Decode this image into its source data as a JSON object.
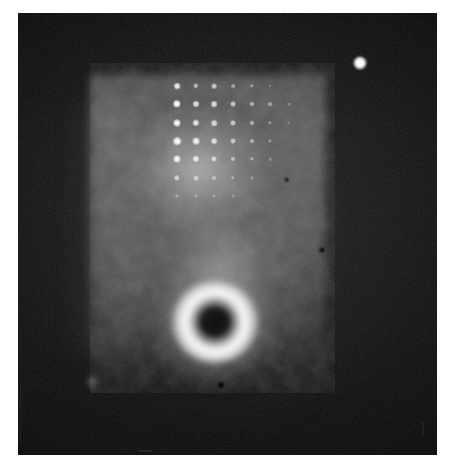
{
  "figure": {
    "kind": "photographic-plate-image",
    "caption": "",
    "background_color": "#ffffff",
    "plate_color": "#070707",
    "plate": {
      "x": 18,
      "y": 13,
      "width": 419,
      "height": 442
    }
  },
  "chart_data": {
    "type": "scatter",
    "title": "",
    "subtitle": "",
    "xlabel": "",
    "ylabel": "",
    "grid": false,
    "legend": "none",
    "xlim": [
      0,
      419
    ],
    "ylim": [
      0,
      442
    ],
    "features": [
      {
        "name": "diffuse-glow-field",
        "shape": "rectangle",
        "x": 72,
        "y": 62,
        "width": 235,
        "height": 316,
        "peak_brightness": 0.72,
        "color": "#b9b9b9"
      },
      {
        "name": "bright-annulus",
        "shape": "annulus",
        "cx": 197,
        "cy": 309,
        "outer_radius": 43,
        "inner_radius": 13,
        "peak_brightness": 0.99,
        "core_brightness": 0.09,
        "color": "#fcfcfc"
      },
      {
        "name": "isolated-bright-spot",
        "shape": "point",
        "cx": 342,
        "cy": 50,
        "radius": 6.5,
        "brightness": 1.0,
        "color": "#ffffff"
      }
    ],
    "lattice": {
      "name": "bright-dot-lattice",
      "rows": 6,
      "cols": 7,
      "origin_x": 159,
      "origin_y": 73,
      "dx": 18.6,
      "dy": 18.2,
      "points": [
        {
          "row": 0,
          "col": 0,
          "x": 159,
          "y": 73,
          "r": 2.6,
          "i": 0.9
        },
        {
          "row": 0,
          "col": 1,
          "x": 178,
          "y": 73,
          "r": 2.1,
          "i": 0.62
        },
        {
          "row": 0,
          "col": 2,
          "x": 196,
          "y": 73,
          "r": 2.2,
          "i": 0.7
        },
        {
          "row": 0,
          "col": 3,
          "x": 215,
          "y": 73,
          "r": 1.8,
          "i": 0.46
        },
        {
          "row": 0,
          "col": 4,
          "x": 234,
          "y": 73,
          "r": 1.7,
          "i": 0.4
        },
        {
          "row": 0,
          "col": 5,
          "x": 252,
          "y": 73,
          "r": 1.3,
          "i": 0.22
        },
        {
          "row": 1,
          "col": 0,
          "x": 159,
          "y": 91,
          "r": 3.2,
          "i": 1.0
        },
        {
          "row": 1,
          "col": 1,
          "x": 178,
          "y": 91,
          "r": 2.7,
          "i": 0.82
        },
        {
          "row": 1,
          "col": 2,
          "x": 196,
          "y": 91,
          "r": 2.6,
          "i": 0.8
        },
        {
          "row": 1,
          "col": 3,
          "x": 215,
          "y": 91,
          "r": 2.3,
          "i": 0.68
        },
        {
          "row": 1,
          "col": 4,
          "x": 234,
          "y": 91,
          "r": 2.0,
          "i": 0.56
        },
        {
          "row": 1,
          "col": 5,
          "x": 252,
          "y": 91,
          "r": 1.8,
          "i": 0.44
        },
        {
          "row": 1,
          "col": 6,
          "x": 271,
          "y": 91,
          "r": 1.4,
          "i": 0.26
        },
        {
          "row": 2,
          "col": 0,
          "x": 159,
          "y": 110,
          "r": 3.1,
          "i": 0.98
        },
        {
          "row": 2,
          "col": 1,
          "x": 178,
          "y": 110,
          "r": 2.8,
          "i": 0.86
        },
        {
          "row": 2,
          "col": 2,
          "x": 196,
          "y": 110,
          "r": 2.5,
          "i": 0.76
        },
        {
          "row": 2,
          "col": 3,
          "x": 215,
          "y": 110,
          "r": 2.3,
          "i": 0.66
        },
        {
          "row": 2,
          "col": 4,
          "x": 234,
          "y": 110,
          "r": 2.0,
          "i": 0.54
        },
        {
          "row": 2,
          "col": 5,
          "x": 252,
          "y": 110,
          "r": 1.7,
          "i": 0.38
        },
        {
          "row": 2,
          "col": 6,
          "x": 271,
          "y": 110,
          "r": 1.3,
          "i": 0.22
        },
        {
          "row": 3,
          "col": 0,
          "x": 159,
          "y": 128,
          "r": 3.3,
          "i": 1.0
        },
        {
          "row": 3,
          "col": 1,
          "x": 178,
          "y": 128,
          "r": 3.0,
          "i": 0.92
        },
        {
          "row": 3,
          "col": 2,
          "x": 196,
          "y": 128,
          "r": 2.6,
          "i": 0.78
        },
        {
          "row": 3,
          "col": 3,
          "x": 215,
          "y": 128,
          "r": 2.3,
          "i": 0.64
        },
        {
          "row": 3,
          "col": 4,
          "x": 234,
          "y": 128,
          "r": 1.9,
          "i": 0.5
        },
        {
          "row": 3,
          "col": 5,
          "x": 252,
          "y": 128,
          "r": 1.6,
          "i": 0.34
        },
        {
          "row": 4,
          "col": 0,
          "x": 159,
          "y": 146,
          "r": 3.1,
          "i": 0.96
        },
        {
          "row": 4,
          "col": 1,
          "x": 178,
          "y": 146,
          "r": 2.8,
          "i": 0.88
        },
        {
          "row": 4,
          "col": 2,
          "x": 196,
          "y": 146,
          "r": 2.4,
          "i": 0.72
        },
        {
          "row": 4,
          "col": 3,
          "x": 215,
          "y": 146,
          "r": 2.0,
          "i": 0.56
        },
        {
          "row": 4,
          "col": 4,
          "x": 234,
          "y": 146,
          "r": 1.7,
          "i": 0.4
        },
        {
          "row": 4,
          "col": 5,
          "x": 252,
          "y": 146,
          "r": 1.4,
          "i": 0.26
        },
        {
          "row": 5,
          "col": 0,
          "x": 159,
          "y": 165,
          "r": 2.4,
          "i": 0.66
        },
        {
          "row": 5,
          "col": 1,
          "x": 178,
          "y": 165,
          "r": 2.2,
          "i": 0.58
        },
        {
          "row": 5,
          "col": 2,
          "x": 196,
          "y": 165,
          "r": 1.9,
          "i": 0.46
        },
        {
          "row": 5,
          "col": 3,
          "x": 215,
          "y": 165,
          "r": 1.7,
          "i": 0.38
        },
        {
          "row": 5,
          "col": 4,
          "x": 234,
          "y": 165,
          "r": 1.5,
          "i": 0.3
        },
        {
          "row": 6,
          "col": 0,
          "x": 159,
          "y": 183,
          "r": 1.7,
          "i": 0.34
        },
        {
          "row": 6,
          "col": 1,
          "x": 178,
          "y": 183,
          "r": 1.6,
          "i": 0.3
        },
        {
          "row": 6,
          "col": 2,
          "x": 196,
          "y": 183,
          "r": 1.5,
          "i": 0.26
        },
        {
          "row": 6,
          "col": 3,
          "x": 215,
          "y": 183,
          "r": 1.4,
          "i": 0.22
        }
      ]
    },
    "specks": [
      {
        "name": "dark-speck-right",
        "x": 269,
        "y": 167,
        "r": 2.2
      },
      {
        "name": "dark-speck-edge",
        "x": 304,
        "y": 237,
        "r": 2.6
      },
      {
        "name": "dark-speck-below-annulus",
        "x": 203,
        "y": 372,
        "r": 3.0
      }
    ],
    "faint_spots": [
      {
        "name": "faint-spot-lower-left",
        "x": 74,
        "y": 369,
        "r": 7
      }
    ]
  }
}
